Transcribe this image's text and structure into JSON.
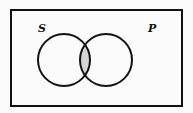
{
  "diagram": {
    "type": "venn",
    "sets": [
      {
        "label": "S"
      },
      {
        "label": "P"
      }
    ],
    "shaded_region": "S∩P",
    "colors": {
      "stroke": "#111111",
      "shade": "#d4d4d4",
      "background": "#fbfbfb"
    }
  }
}
